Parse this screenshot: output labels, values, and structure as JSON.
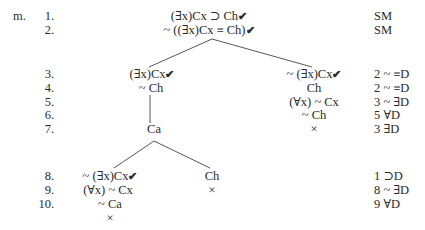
{
  "problem_label": "m.",
  "rows": [
    {
      "num": "1.",
      "just": "SM"
    },
    {
      "num": "2.",
      "just": "SM"
    },
    {
      "num": "3.",
      "just": "2 ~ ≡D"
    },
    {
      "num": "4.",
      "just": "2 ~ ≡D"
    },
    {
      "num": "5.",
      "just": "3 ~ ∃D"
    },
    {
      "num": "6.",
      "just": "5 ∀D"
    },
    {
      "num": "7.",
      "just": "3 ∃D"
    },
    {
      "num": "8.",
      "just": "1 ⊃D"
    },
    {
      "num": "9.",
      "just": "8 ~ ∃D"
    },
    {
      "num": "10.",
      "just": "9 ∀D"
    }
  ],
  "tree": {
    "trunk": {
      "line1": "(∃x)Cx ⊃ Ch",
      "line2": "~ ((∃x)Cx ≡ Ch)",
      "line1_checked": "✔",
      "line2_checked": "✔"
    },
    "left_branch": {
      "line3": "(∃x)Cx",
      "line3_check": "✔",
      "line4": "~ Ch",
      "line7": "Ca",
      "sub_left": {
        "line8": "~ (∃x)Cx",
        "line8_check": "✔",
        "line9": "(∀x) ~ Cx",
        "line10": "~ Ca",
        "closed": "×"
      },
      "sub_right": {
        "line8": "Ch",
        "closed": "×"
      }
    },
    "right_branch": {
      "line3": "~ (∃x)Cx",
      "line3_check": "✔",
      "line4": "Ch",
      "line5": "(∀x) ~ Cx",
      "line6": "~ Ch",
      "closed": "×"
    }
  }
}
